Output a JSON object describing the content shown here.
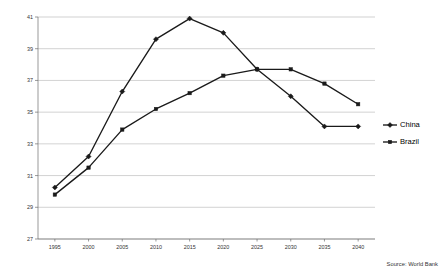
{
  "chart_data": {
    "type": "line",
    "title": "",
    "subtitle": "",
    "xlabel": "",
    "ylabel": "",
    "categories": [
      "1995",
      "2000",
      "2005",
      "2010",
      "2015",
      "2020",
      "2025",
      "2030",
      "2035",
      "2040"
    ],
    "x": [
      1995,
      2000,
      2005,
      2010,
      2015,
      2020,
      2025,
      2030,
      2035,
      2040
    ],
    "series": [
      {
        "name": "China",
        "marker": "diamond",
        "color": "#1a1a1a",
        "values": [
          30.25,
          32.2,
          36.3,
          39.6,
          40.9,
          40.0,
          37.7,
          36.0,
          34.1,
          34.1
        ]
      },
      {
        "name": "Brazil",
        "marker": "square",
        "color": "#1a1a1a",
        "values": [
          29.8,
          31.5,
          33.9,
          35.2,
          36.2,
          37.3,
          37.7,
          37.7,
          36.8,
          35.5
        ]
      }
    ],
    "ylim": [
      27,
      41
    ],
    "yticks": [
      27,
      29,
      31,
      33,
      35,
      37,
      39,
      41
    ],
    "ytick_labels": [
      "27",
      "29",
      "31",
      "33",
      "35",
      "37",
      "39",
      "41"
    ],
    "xtick_labels": [
      "1995",
      "2000",
      "2005",
      "2010",
      "2015",
      "2020",
      "2025",
      "2030",
      "2035",
      "2040"
    ],
    "grid": "horizontal",
    "legend_position": "right",
    "legend_entries": [
      "China",
      "Brazil"
    ]
  },
  "annotations": {
    "source": "Source: World Bank"
  },
  "colors": {
    "series_line": "#1a1a1a",
    "gridline": "#b4b4b4",
    "axis": "#6e6e6e",
    "background": "#ffffff"
  }
}
